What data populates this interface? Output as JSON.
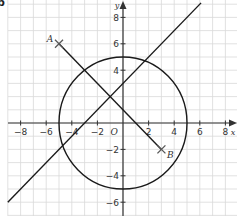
{
  "part_label": "b",
  "axes": {
    "x_label": "x",
    "y_label": "y",
    "origin_label": "O",
    "x_ticks": [
      -8,
      -6,
      -4,
      -2,
      2,
      4,
      6,
      8
    ],
    "y_ticks": [
      8,
      6,
      4,
      -2,
      -4,
      -6
    ],
    "x_range": [
      -9,
      9
    ],
    "y_range": [
      -7,
      9
    ]
  },
  "points": [
    {
      "label": "A",
      "x": -5,
      "y": 6
    },
    {
      "label": "B",
      "x": 3,
      "y": -2
    }
  ],
  "shapes": {
    "circle": {
      "cx": 0,
      "cy": 0,
      "r": 5
    },
    "line": {
      "equation": "y = x + 3"
    },
    "segment": {
      "from": "A",
      "to": "B"
    }
  },
  "colors": {
    "grid": "#d9d9d9",
    "axis": "#333333",
    "curve": "#1a1a1a",
    "text": "#333333"
  }
}
